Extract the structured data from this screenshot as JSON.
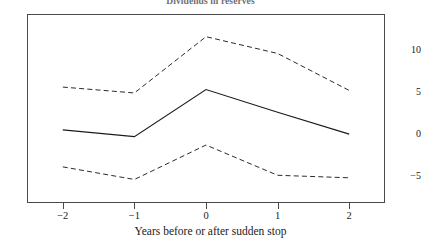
{
  "chart_data": {
    "type": "line",
    "title": "Dividends in reserves",
    "xlabel": "Years before or after sudden stop",
    "ylabel": "",
    "x": [
      -2,
      -1,
      0,
      1,
      2
    ],
    "xticklabels": [
      "−2",
      "−1",
      "0",
      "1",
      "2"
    ],
    "yticks": [
      10,
      5,
      0,
      -5
    ],
    "yticklabels": [
      "10",
      "5",
      "0",
      "−5"
    ],
    "xlim": [
      -2.5,
      2.5
    ],
    "ylim": [
      -8.2,
      14.3
    ],
    "grid": false,
    "legend": "none",
    "series": [
      {
        "name": "Upper confidence band",
        "style": "dashed",
        "color": "#2b2b2b",
        "values": [
          5.6,
          4.9,
          11.6,
          9.6,
          5.2
        ]
      },
      {
        "name": "Point estimate",
        "style": "solid",
        "color": "#1a1a1a",
        "values": [
          0.5,
          -0.3,
          5.3,
          2.6,
          0.0
        ]
      },
      {
        "name": "Lower confidence band",
        "style": "dashed",
        "color": "#2b2b2b",
        "values": [
          -3.9,
          -5.4,
          -1.3,
          -4.9,
          -5.2
        ]
      }
    ]
  },
  "figure": {
    "background_color": "#ffffff",
    "frame_color": "#4a4a4a"
  }
}
